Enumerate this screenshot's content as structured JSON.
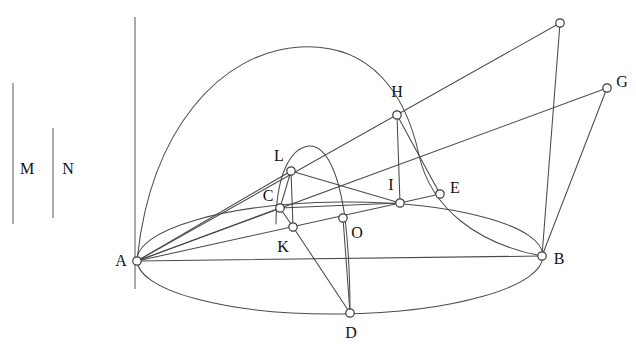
{
  "figure": {
    "type": "geometry-diagram",
    "background_color": "#ffffff",
    "line_color": "#4a4a4a",
    "label_color": "#111111",
    "node_fill": "#ffffff",
    "width": 636,
    "height": 355
  },
  "labels": {
    "M": "M",
    "N": "N",
    "A": "A",
    "B": "B",
    "C": "C",
    "D": "D",
    "E": "E",
    "G": "G",
    "H": "H",
    "I": "I",
    "K": "K",
    "L": "L",
    "O": "O"
  },
  "points": [
    {
      "id": "A",
      "label": "A",
      "x": 137,
      "y": 261,
      "label_x": 121,
      "label_y": 261,
      "marker": true
    },
    {
      "id": "B",
      "label": "B",
      "x": 542,
      "y": 256,
      "label_x": 559,
      "label_y": 259,
      "marker": true
    },
    {
      "id": "C",
      "label": "C",
      "x": 280,
      "y": 208,
      "label_x": 268,
      "label_y": 196,
      "marker": true
    },
    {
      "id": "D",
      "label": "D",
      "x": 350,
      "y": 313,
      "label_x": 351,
      "label_y": 333,
      "marker": true
    },
    {
      "id": "E",
      "label": "E",
      "x": 440,
      "y": 194,
      "label_x": 455,
      "label_y": 188,
      "marker": true
    },
    {
      "id": "F",
      "label": "",
      "x": 560,
      "y": 23,
      "label_x": 560,
      "label_y": 23,
      "marker": true
    },
    {
      "id": "G",
      "label": "G",
      "x": 607,
      "y": 88,
      "label_x": 622,
      "label_y": 82,
      "marker": true
    },
    {
      "id": "H",
      "label": "H",
      "x": 397,
      "y": 115,
      "label_x": 397,
      "label_y": 92,
      "marker": true
    },
    {
      "id": "I",
      "label": "I",
      "x": 400,
      "y": 203,
      "label_x": 391,
      "label_y": 185,
      "marker": true
    },
    {
      "id": "K",
      "label": "K",
      "x": 293,
      "y": 227,
      "label_x": 283,
      "label_y": 247,
      "marker": true
    },
    {
      "id": "L",
      "label": "L",
      "x": 291,
      "y": 171,
      "label_x": 279,
      "label_y": 156,
      "marker": true
    },
    {
      "id": "O",
      "label": "O",
      "x": 343,
      "y": 218,
      "label_x": 357,
      "label_y": 233,
      "marker": true
    }
  ],
  "measure_segments": [
    {
      "id": "M",
      "label": "M",
      "x": 13,
      "y1": 83,
      "y2": 224,
      "label_x": 27,
      "label_y": 169
    },
    {
      "id": "N",
      "label": "N",
      "x": 53,
      "y1": 128,
      "y2": 218,
      "label_x": 68,
      "label_y": 169
    }
  ],
  "axis": {
    "id": "vertical-axis",
    "x": 135,
    "y1": 17,
    "y2": 289
  },
  "segments": [
    {
      "id": "A-B",
      "from": "A",
      "to": "B"
    },
    {
      "id": "A-F",
      "from": "A",
      "to": "F"
    },
    {
      "id": "A-G",
      "from": "A",
      "to": "G"
    },
    {
      "id": "A-L",
      "from": "A",
      "to": "L"
    },
    {
      "id": "A-C",
      "from": "A",
      "to": "C"
    },
    {
      "id": "A-K",
      "from": "A",
      "to": "K"
    },
    {
      "id": "F-B",
      "from": "F",
      "to": "B"
    },
    {
      "id": "G-B",
      "from": "G",
      "to": "B"
    },
    {
      "id": "H-I",
      "from": "H",
      "to": "I"
    },
    {
      "id": "H-E",
      "from": "H",
      "to": "E"
    },
    {
      "id": "E-I",
      "from": "E",
      "to": "I"
    },
    {
      "id": "L-I",
      "from": "L",
      "to": "I"
    },
    {
      "id": "L-C",
      "from": "L",
      "to": "C"
    },
    {
      "id": "L-K",
      "from": "L",
      "to": "K"
    },
    {
      "id": "C-I",
      "from": "C",
      "to": "I"
    },
    {
      "id": "C-K",
      "from": "C",
      "to": "K"
    },
    {
      "id": "K-D",
      "from": "K",
      "to": "D"
    },
    {
      "id": "O-D",
      "from": "O",
      "to": "D"
    }
  ],
  "curves": [
    {
      "id": "base-ellipse",
      "kind": "ellipse",
      "cx": 340,
      "cy": 258,
      "rx": 203,
      "ry": 56,
      "rotation": -0.6
    },
    {
      "id": "great-arc",
      "kind": "arc",
      "from": "A",
      "to": "B",
      "apex_x": 330,
      "apex_y": 50
    },
    {
      "id": "inner-parabola",
      "kind": "arc",
      "apex_x": 308,
      "apex_y": 146
    }
  ]
}
